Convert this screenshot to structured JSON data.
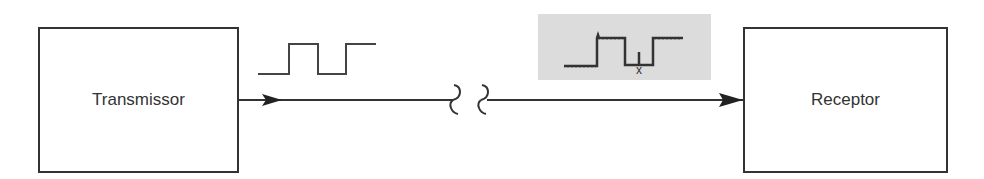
{
  "diagram": {
    "transmitter": {
      "label": "Transmissor"
    },
    "receiver": {
      "label": "Receptor"
    },
    "clean_signal": {
      "description": "square pulse waveform"
    },
    "noisy_signal": {
      "description": "distorted square pulse with noise",
      "marker_label": "x"
    },
    "channel": {
      "break_symbol": "≀ ≀"
    },
    "colors": {
      "stroke": "#333333",
      "noise_bg": "#dcdcdc"
    }
  }
}
